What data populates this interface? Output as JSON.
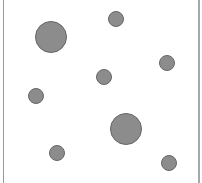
{
  "scene": {
    "width": 202,
    "height": 183,
    "background": "#ffffff",
    "frame_color": "#9a9a9a",
    "circle_fill": "#8c8c8c",
    "circle_stroke": "#666666",
    "circles": [
      {
        "id": "large-1",
        "cx": 51,
        "cy": 37,
        "r": 15.5
      },
      {
        "id": "small-1",
        "cx": 116,
        "cy": 19,
        "r": 7.5
      },
      {
        "id": "small-2",
        "cx": 167,
        "cy": 63,
        "r": 7.5
      },
      {
        "id": "small-3",
        "cx": 104,
        "cy": 77,
        "r": 7.5
      },
      {
        "id": "small-4",
        "cx": 36,
        "cy": 96,
        "r": 7.5
      },
      {
        "id": "large-2",
        "cx": 126,
        "cy": 129,
        "r": 15.5
      },
      {
        "id": "small-5",
        "cx": 57,
        "cy": 153,
        "r": 7.5
      },
      {
        "id": "small-6",
        "cx": 169,
        "cy": 163,
        "r": 7.5
      }
    ]
  }
}
